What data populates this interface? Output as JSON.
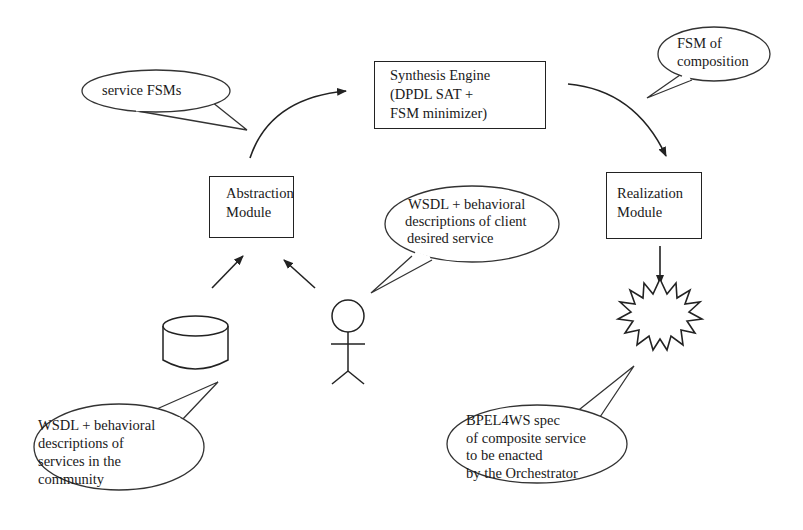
{
  "diagram": {
    "nodes": {
      "synthesis_engine": {
        "lines": [
          "Synthesis Engine",
          "(DPDL SAT +",
          "FSM minimizer)"
        ]
      },
      "abstraction_module": {
        "lines": [
          "Abstraction",
          "Module"
        ]
      },
      "realization_module": {
        "lines": [
          "Realization",
          "Module"
        ]
      }
    },
    "callouts": {
      "service_fsms": {
        "lines": [
          "service FSMs"
        ]
      },
      "fsm_of_composition": {
        "lines": [
          "FSM of",
          "composition"
        ]
      },
      "client_description": {
        "lines": [
          "WSDL + behavioral",
          "descriptions of client",
          "desired service"
        ]
      },
      "community_services": {
        "lines": [
          "WSDL + behavioral",
          "descriptions of",
          "services in the",
          "community"
        ]
      },
      "bpel_spec": {
        "lines": [
          "BPEL4WS spec",
          "of composite service",
          "to be enacted",
          "by the Orchestrator"
        ]
      }
    },
    "icons": {
      "database": "database-cylinder",
      "client": "stick-figure-actor",
      "output": "starburst"
    },
    "edges": [
      {
        "from": "abstraction_module",
        "to": "synthesis_engine",
        "style": "curved-arrow"
      },
      {
        "from": "synthesis_engine",
        "to": "realization_module",
        "style": "curved-arrow"
      },
      {
        "from": "database",
        "to": "abstraction_module",
        "style": "arrow"
      },
      {
        "from": "client",
        "to": "abstraction_module",
        "style": "arrow"
      },
      {
        "from": "realization_module",
        "to": "starburst",
        "style": "arrow"
      }
    ],
    "colors": {
      "stroke": "#222222",
      "background": "#ffffff",
      "text": "#1a1a1a"
    }
  }
}
